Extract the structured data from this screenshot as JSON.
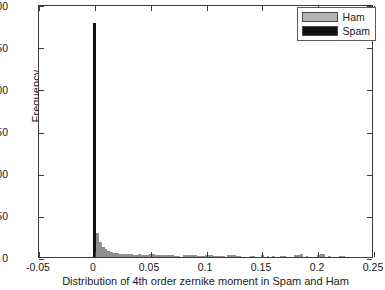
{
  "chart_data": {
    "type": "bar",
    "title": "",
    "xlabel": "Distribution of 4th order zernike moment in Spam and Ham",
    "ylabel": "Frequency",
    "xlim": [
      -0.05,
      0.25
    ],
    "ylim": [
      0,
      300
    ],
    "xticks": [
      "-0.05",
      "0",
      "0.05",
      "0.1",
      "0.15",
      "0.2",
      "0.25"
    ],
    "xtick_values": [
      -0.05,
      0,
      0.05,
      0.1,
      0.15,
      0.2,
      0.25
    ],
    "yticks": [
      "0",
      "50",
      "100",
      "150",
      "200",
      "250",
      "300"
    ],
    "ytick_values": [
      0,
      50,
      100,
      150,
      200,
      250,
      300
    ],
    "grid": false,
    "legend_position": "top-right",
    "bin_width": 0.0025,
    "series": [
      {
        "name": "Spam",
        "color": "#111111",
        "x": [
          0.0
        ],
        "values": [
          277
        ]
      },
      {
        "name": "Ham",
        "color": "#8f8f8f",
        "x": [
          0.0025,
          0.005,
          0.0075,
          0.01,
          0.0125,
          0.015,
          0.0175,
          0.02,
          0.0225,
          0.025,
          0.0275,
          0.03,
          0.0325,
          0.035,
          0.0375,
          0.04,
          0.0425,
          0.045,
          0.0475,
          0.05,
          0.0525,
          0.055,
          0.0575,
          0.06,
          0.0625,
          0.065,
          0.0675,
          0.07,
          0.0725,
          0.075,
          0.08,
          0.0825,
          0.085,
          0.0875,
          0.09,
          0.0925,
          0.095,
          0.0975,
          0.1,
          0.1025,
          0.105,
          0.1075,
          0.11,
          0.1125,
          0.115,
          0.12,
          0.1225,
          0.125,
          0.1275,
          0.13,
          0.14,
          0.1425,
          0.15,
          0.155,
          0.16,
          0.1675,
          0.17,
          0.18,
          0.1825,
          0.185,
          0.19,
          0.2,
          0.2025,
          0.205,
          0.21,
          0.22,
          0.2225
        ],
        "values": [
          28,
          18,
          12,
          9,
          7,
          6,
          5,
          5,
          4,
          4,
          3,
          3,
          3,
          2,
          2,
          3,
          2,
          2,
          2,
          4,
          3,
          2,
          2,
          2,
          2,
          2,
          2,
          2,
          1,
          1,
          2,
          2,
          2,
          2,
          2,
          1,
          1,
          1,
          2,
          2,
          2,
          1,
          1,
          1,
          1,
          2,
          2,
          2,
          1,
          1,
          1,
          1,
          2,
          1,
          1,
          1,
          1,
          2,
          2,
          3,
          1,
          2,
          3,
          3,
          1,
          1,
          1
        ]
      }
    ],
    "legend": [
      {
        "label": "Ham",
        "color": "#b4b4b4"
      },
      {
        "label": "Spam",
        "color": "#111111"
      }
    ]
  }
}
